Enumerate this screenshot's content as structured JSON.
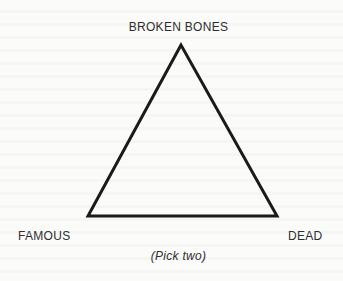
{
  "diagram": {
    "type": "triangle",
    "vertices": {
      "top": "BROKEN BONES",
      "bottom_left": "FAMOUS",
      "bottom_right": "DEAD"
    },
    "caption": "(Pick two)",
    "colors": {
      "line": "#1a1a1a",
      "text": "#2e2e2e",
      "background": "#fbfbfa"
    }
  }
}
